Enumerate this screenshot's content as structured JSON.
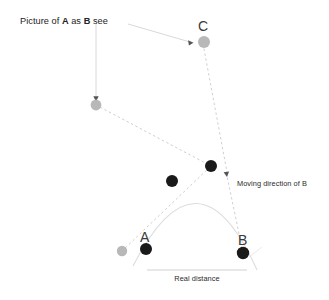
{
  "figure": {
    "type": "diagram",
    "title_text": "",
    "background_color": "#ffffff"
  },
  "labels": {
    "caption_prefix": "Picture of ",
    "caption_bold_a": "A",
    "caption_mid": " as ",
    "caption_bold_b": "B",
    "caption_suffix": " see",
    "caption_full": "Picture of A as B see",
    "moving_direction": "Moving direction of B",
    "real_distance": "Real distance",
    "point_a": "A",
    "point_b": "B",
    "point_c": "C"
  },
  "colors": {
    "dark_marker": "#1a1a1a",
    "light_marker": "#b8b8b8",
    "dotted_line": "#cfcfcf",
    "arc_line": "#dcdcdc",
    "annotation_line": "#d4d4d4",
    "text": "#232323",
    "measure_line": "#d0d0d0"
  },
  "markers": {
    "dark": [
      {
        "name": "marker-a",
        "x": 146,
        "y": 249,
        "r": 6.0,
        "label": "A"
      },
      {
        "name": "marker-arc-left",
        "x": 172,
        "y": 181,
        "r": 6.0,
        "label": ""
      },
      {
        "name": "marker-arc-right",
        "x": 211,
        "y": 166,
        "r": 6.0,
        "label": ""
      },
      {
        "name": "marker-b",
        "x": 243,
        "y": 253,
        "r": 6.2,
        "label": "B"
      }
    ],
    "light": [
      {
        "name": "marker-ghost-a",
        "x": 122,
        "y": 251,
        "r": 5.2,
        "label": ""
      },
      {
        "name": "marker-picture-a",
        "x": 96,
        "y": 105,
        "r": 5.4,
        "label": ""
      },
      {
        "name": "marker-c",
        "x": 204,
        "y": 42,
        "r": 6.0,
        "label": "C"
      }
    ]
  },
  "paths": {
    "trajectory_arc": "M 133 266 Q 198 139 257 270",
    "sight_line_lower": "M 122 251 L 211 166",
    "sight_line_upper": "M 96 105 L 211 166",
    "moving_direction_line": "M 204 48 L 226 171",
    "moving_direction_tail": "M 243 253 L 226 171",
    "caption_pointer_down": "M 96 22 L 96 99",
    "caption_pointer_c": "M 128 24 L 192 42",
    "measure_line": "M 147 270 L 247 270"
  },
  "arrowheads": [
    {
      "name": "arrowhead-to-picture-a",
      "x": 96,
      "y": 100,
      "angle": 90
    },
    {
      "name": "arrowhead-to-c",
      "x": 191,
      "y": 42,
      "angle": 18
    },
    {
      "name": "arrowhead-moving-direction",
      "x": 226,
      "y": 173,
      "angle": 80
    }
  ],
  "axis_ranges": {
    "width": 329,
    "height": 300
  }
}
